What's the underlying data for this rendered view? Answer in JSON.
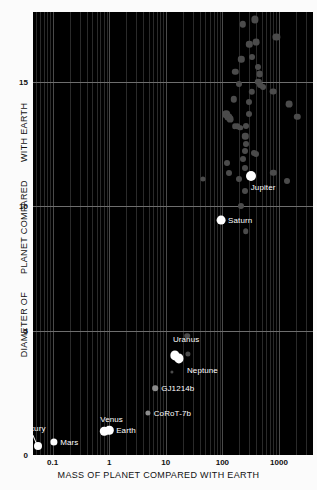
{
  "chart_data": {
    "type": "scatter",
    "title": "",
    "xlabel": "MASS OF PLANET COMPARED WITH EARTH",
    "ylabel_parts": [
      "DIAMETER OF",
      "PLANET COMPARED",
      "WITH EARTH"
    ],
    "ylabel": "DIAMETER OF PLANET COMPARED WITH EARTH",
    "xscale": "log",
    "yscale": "linear",
    "xlim": [
      0.045,
      4000
    ],
    "ylim": [
      0,
      17.8
    ],
    "xticks": [
      "0.1",
      "1",
      "10",
      "100",
      "1000"
    ],
    "xtick_values": [
      0.1,
      1,
      10,
      100,
      1000
    ],
    "yticks": [
      "0",
      "5",
      "10",
      "15"
    ],
    "ytick_values": [
      0,
      5,
      10,
      15
    ],
    "grid": "log-minor-vertical + major-horizontal",
    "legend": "none",
    "background": "#000000",
    "plot_area_px": {
      "left": 33,
      "top": 12,
      "width": 280,
      "height": 443
    },
    "labeled_points": [
      {
        "name": "Mercury",
        "x": 0.055,
        "y": 0.38,
        "color": "#ffffff",
        "r": 4.0,
        "label_dx": -22,
        "label_dy": -18,
        "leader": true
      },
      {
        "name": "Mars",
        "x": 0.107,
        "y": 0.53,
        "color": "#ffffff",
        "r": 3.6,
        "label_dx": 6,
        "label_dy": 0
      },
      {
        "name": "Venus",
        "x": 0.815,
        "y": 0.95,
        "color": "#ffffff",
        "r": 4.2,
        "label_dx": -4,
        "label_dy": -12
      },
      {
        "name": "Earth",
        "x": 1.0,
        "y": 1.0,
        "color": "#ffffff",
        "r": 4.2,
        "label_dx": 7,
        "label_dy": 0
      },
      {
        "name": "CoRoT-7b",
        "x": 4.8,
        "y": 1.68,
        "color": "#8c8c8c",
        "r": 2.6,
        "label_dx": 6,
        "label_dy": 0
      },
      {
        "name": "GJ1214b",
        "x": 6.5,
        "y": 2.68,
        "color": "#8c8c8c",
        "r": 2.8,
        "label_dx": 6,
        "label_dy": 0
      },
      {
        "name": "Uranus",
        "x": 14.5,
        "y": 4.0,
        "color": "#ffffff",
        "r": 4.6,
        "label_dx": -2,
        "label_dy": -16
      },
      {
        "name": "Neptune",
        "x": 17.1,
        "y": 3.88,
        "color": "#ffffff",
        "r": 4.6,
        "label_dx": 8,
        "label_dy": 12
      },
      {
        "name": "Saturn",
        "x": 95.0,
        "y": 9.45,
        "color": "#ffffff",
        "r": 4.4,
        "label_dx": 7,
        "label_dy": 0
      },
      {
        "name": "Jupiter",
        "x": 318.0,
        "y": 11.2,
        "color": "#ffffff",
        "r": 5.0,
        "label_dx": 0,
        "label_dy": 11
      }
    ],
    "exoplanets": [
      {
        "x": 230,
        "y": 17.3,
        "r": 3.2
      },
      {
        "x": 380,
        "y": 17.5,
        "r": 3.6
      },
      {
        "x": 900,
        "y": 16.8,
        "r": 3.6
      },
      {
        "x": 300,
        "y": 16.5,
        "r": 3.2
      },
      {
        "x": 400,
        "y": 16.6,
        "r": 3.4
      },
      {
        "x": 215,
        "y": 15.9,
        "r": 3.2
      },
      {
        "x": 330,
        "y": 16.0,
        "r": 3.0
      },
      {
        "x": 170,
        "y": 15.4,
        "r": 3.2
      },
      {
        "x": 420,
        "y": 15.6,
        "r": 3.0
      },
      {
        "x": 455,
        "y": 15.3,
        "r": 3.4
      },
      {
        "x": 200,
        "y": 14.9,
        "r": 3.0
      },
      {
        "x": 430,
        "y": 15.0,
        "r": 3.2
      },
      {
        "x": 470,
        "y": 14.85,
        "r": 3.0
      },
      {
        "x": 520,
        "y": 14.8,
        "r": 3.0
      },
      {
        "x": 330,
        "y": 14.6,
        "r": 3.2
      },
      {
        "x": 800,
        "y": 14.6,
        "r": 3.4
      },
      {
        "x": 160,
        "y": 14.3,
        "r": 3.2
      },
      {
        "x": 300,
        "y": 14.2,
        "r": 3.0
      },
      {
        "x": 1500,
        "y": 14.1,
        "r": 3.4
      },
      {
        "x": 118,
        "y": 13.7,
        "r": 3.8
      },
      {
        "x": 128,
        "y": 13.6,
        "r": 3.6
      },
      {
        "x": 135,
        "y": 13.5,
        "r": 3.4
      },
      {
        "x": 290,
        "y": 13.7,
        "r": 3.0
      },
      {
        "x": 2100,
        "y": 13.6,
        "r": 3.2
      },
      {
        "x": 165,
        "y": 13.2,
        "r": 2.8
      },
      {
        "x": 185,
        "y": 13.2,
        "r": 2.8
      },
      {
        "x": 205,
        "y": 13.15,
        "r": 2.8
      },
      {
        "x": 260,
        "y": 13.2,
        "r": 3.0
      },
      {
        "x": 255,
        "y": 12.8,
        "r": 3.2
      },
      {
        "x": 265,
        "y": 12.5,
        "r": 3.0
      },
      {
        "x": 250,
        "y": 12.2,
        "r": 3.0
      },
      {
        "x": 360,
        "y": 12.15,
        "r": 3.0
      },
      {
        "x": 400,
        "y": 12.1,
        "r": 3.0
      },
      {
        "x": 230,
        "y": 11.9,
        "r": 3.0
      },
      {
        "x": 120,
        "y": 11.75,
        "r": 3.0
      },
      {
        "x": 250,
        "y": 11.55,
        "r": 3.0
      },
      {
        "x": 130,
        "y": 11.35,
        "r": 3.0
      },
      {
        "x": 800,
        "y": 11.35,
        "r": 3.2
      },
      {
        "x": 45,
        "y": 11.1,
        "r": 2.6
      },
      {
        "x": 200,
        "y": 11.1,
        "r": 3.0
      },
      {
        "x": 1400,
        "y": 11.0,
        "r": 3.0
      },
      {
        "x": 255,
        "y": 10.6,
        "r": 3.0
      },
      {
        "x": 215,
        "y": 10.0,
        "r": 3.0
      },
      {
        "x": 260,
        "y": 9.0,
        "r": 2.8
      },
      {
        "x": 24,
        "y": 4.8,
        "r": 2.8
      },
      {
        "x": 25,
        "y": 4.05,
        "r": 2.6
      },
      {
        "x": 13.0,
        "y": 3.35,
        "r": 1.6
      }
    ]
  }
}
